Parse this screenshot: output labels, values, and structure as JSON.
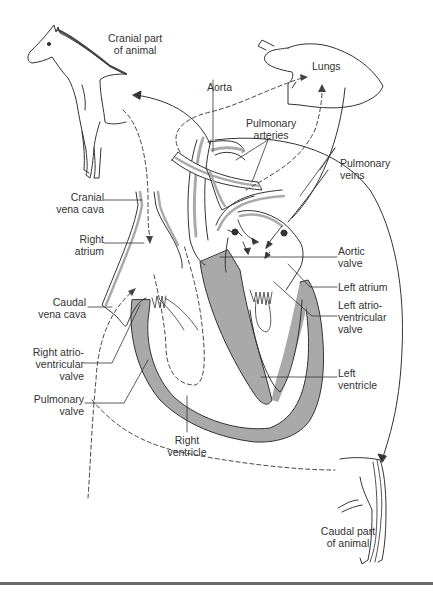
{
  "figure": {
    "rule_color": "#6b6b6b",
    "muscle_color": "#a9a9a9",
    "line_color": "#333333"
  },
  "labels": {
    "cranial_part": [
      "Cranial part",
      "of animal"
    ],
    "lungs": [
      "Lungs"
    ],
    "aorta": [
      "Aorta"
    ],
    "pulmonary_arteries": [
      "Pulmonary",
      "arteries"
    ],
    "pulmonary_veins": [
      "Pulmonary",
      "veins"
    ],
    "cranial_vena_cava": [
      "Cranial",
      "vena cava"
    ],
    "right_atrium": [
      "Right",
      "atrium"
    ],
    "aortic_valve": [
      "Aortic",
      "valve"
    ],
    "left_atrium": [
      "Left atrium"
    ],
    "left_av_valve": [
      "Left atrio-",
      "ventricular",
      "valve"
    ],
    "caudal_vena_cava": [
      "Caudal",
      "vena cava"
    ],
    "right_av_valve": [
      "Right atrio-",
      "ventricular",
      "valve"
    ],
    "pulmonary_valve": [
      "Pulmonary",
      "valve"
    ],
    "left_ventricle": [
      "Left",
      "ventricle"
    ],
    "right_ventricle": [
      "Right",
      "ventricle"
    ],
    "caudal_part": [
      "Caudal part",
      "of animal"
    ]
  }
}
